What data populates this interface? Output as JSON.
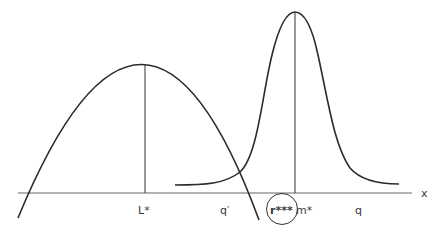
{
  "diagram": {
    "axis": {
      "label": "x",
      "y": 193,
      "x_start": 18,
      "x_end": 412
    },
    "curves": [
      {
        "name": "parabola",
        "peak_label": "L*",
        "peak": [
          145,
          64
        ]
      },
      {
        "name": "bell-curve",
        "peak_label": "m*",
        "peak": [
          295,
          12
        ]
      }
    ],
    "labels": {
      "L_star": "L*",
      "q_prime": "q′",
      "r_triple_star": "r***",
      "m_star": "m*",
      "q": "q",
      "x": "x"
    },
    "highlight": {
      "target": "r***",
      "shape": "circle"
    },
    "colors": {
      "stroke": "#2b2b2b",
      "axis": "#555555",
      "text": "#3a3a3a"
    }
  }
}
